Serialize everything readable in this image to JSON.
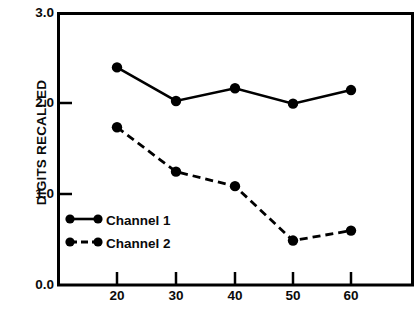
{
  "chart_data": {
    "type": "line",
    "title": "",
    "xlabel": "AGE GROUP",
    "ylabel": "DIGITS RECALLED",
    "categories": [
      20,
      30,
      40,
      50,
      60
    ],
    "x_tick_labels": [
      "20",
      "30",
      "40",
      "50",
      "60"
    ],
    "y_tick_labels": [
      "0.0",
      "1.0",
      "2.0",
      "3.0"
    ],
    "y_ticks": [
      0.0,
      1.0,
      2.0,
      3.0
    ],
    "xlim": [
      14,
      66
    ],
    "ylim": [
      0.0,
      3.0
    ],
    "grid": false,
    "legend_position": "inside-lower-left",
    "series": [
      {
        "name": "Channel 1",
        "line_style": "solid",
        "marker": "filled-circle",
        "color": "#000000",
        "values": [
          2.4,
          2.03,
          2.17,
          2.0,
          2.15
        ]
      },
      {
        "name": "Channel 2",
        "line_style": "dashed",
        "marker": "filled-circle",
        "color": "#000000",
        "values": [
          1.74,
          1.25,
          1.09,
          0.49,
          0.6
        ]
      }
    ]
  },
  "axes": {
    "y_title": "DIGITS RECALLED",
    "x_title": "AGE GROUP",
    "y_labels": [
      "3.0",
      "2.0",
      "1.0",
      "0.0"
    ],
    "x_labels": [
      "20",
      "30",
      "40",
      "50",
      "60"
    ]
  },
  "legend": {
    "entries": [
      {
        "label": "Channel 1",
        "style": "solid"
      },
      {
        "label": "Channel 2",
        "style": "dashed"
      }
    ]
  },
  "style": {
    "ink": "#000000",
    "background": "#ffffff"
  }
}
